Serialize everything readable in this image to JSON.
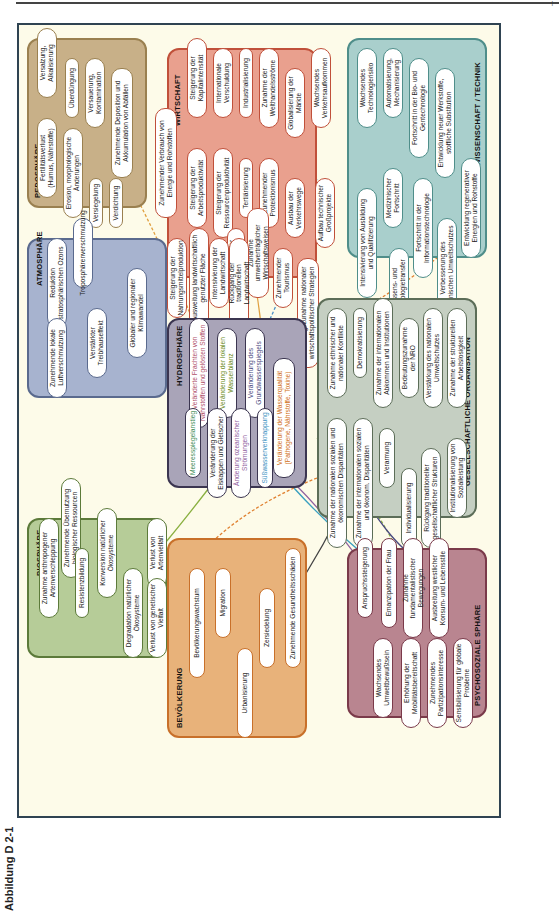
{
  "page": {
    "number": "|",
    "caption": "Abbildung D 2-1"
  },
  "spheres": {
    "pedosphaere": {
      "title": "PEDOSPHÄRE",
      "color": "#c8b088",
      "border": "#9a8050",
      "items": [
        "Versalzung, Alkalisierung",
        "Überdüngung",
        "Versauerung, Kontamination",
        "Zunehmende Deposition und Akkumulation von Abfällen",
        "Fertilitätsverlust (Humus, Nährstoffe)",
        "Erosion, morphologische Änderungen",
        "Versiegelung",
        "Verdichtung"
      ]
    },
    "wirtschaft": {
      "title": "WIRTSCHAFT",
      "color": "#e9a08e",
      "border": "#c0503a",
      "items": [
        "Zunehmender Verbrauch von Energie und Rohstoffen",
        "Steigerung der Kapitalintensität",
        "Internationale Verschuldung",
        "Industrialisierung",
        "Zunahme der Welthandelsströme",
        "Globalisierung der Märkte",
        "Wachsendes Verkehrsaufkommen",
        "Steigerung der Arbeitsproduktivität",
        "Steigerung der Ressourcenproduktivität",
        "Tertiärisierung",
        "Zunehmender Protektionismus",
        "Ausbau der Verkehrswege",
        "Aufbau technischer Großprojekte",
        "Zunahme umweltverträglicher Wirtschaftsweisen",
        "Ausbreitung der Geldwirtschaft",
        "Zunehmender Tourismus",
        "Bedeutungszunahme nationaler wirtschaftspolitischer Strategien",
        "Steigerung der Nahrungsmittelproduktion",
        "Ausweitung landwirtschaftlich genutzter Fläche",
        "Intensivierung der Landwirtschaft",
        "Rückgang der traditionellen Landwirtschaft"
      ]
    },
    "wissenschaft": {
      "title": "WISSENSCHAFT / TECHNIK",
      "color": "#a9cfcc",
      "border": "#4f8e8a",
      "items": [
        "Wachsendes Technologierisiko",
        "Automatisierung, Mechanisierung",
        "Fortschritt in der Bio- und Gentechnologie",
        "Entwicklung neuer Werkstoffe, stoffliche Substitution",
        "Intensivierung von Ausbildung und Qualifizierung",
        "Medizinischer Fortschritt",
        "Wissens- und Technologietransfer",
        "Fortschritt in der Informationstechnologie",
        "Verbesserung des technischen Umweltschutzes",
        "Entwicklung regenerativer Energien und Rohstoffe"
      ]
    },
    "atmosphaere": {
      "title": "ATMOSPHÄRE",
      "color": "#a7b3cf",
      "border": "#5a6a8e",
      "items": [
        "Reduktion stratosphärischen Ozons",
        "Troposphärenverschmutzung",
        "Zunehmende lokale Luftverschmutzung",
        "Verstärkter Treibhauseffekt",
        "Globaler und regionaler Klimawandel"
      ]
    },
    "hydrosphaere": {
      "title": "HYDROSPHÄRE",
      "color": "#a9a4b8",
      "border": "#3b3550",
      "items": [
        "Veränderte Frachten von Nährstoffen und gelösten Stoffen",
        "Veränderung der lokalen Wasserbilanz",
        "Veränderung des Grundwasserspiegels",
        "Veränderung der Wasserqualität (Pathogene, Nährstoffe, Toxine)",
        "Meeresspiegelanstieg",
        "Veränderung der Eiskappen und Gletscher",
        "Änderung ozeanischer Strömungen",
        "Süßwasserverknappung"
      ]
    },
    "gesellschaft": {
      "title": "GESELLSCHAFTLICHE ORGANISATION",
      "color": "#c5cfc2",
      "border": "#5c6d58",
      "items": [
        "Zunahme ethnischer und nationaler Konflikte",
        "Demokratisierung",
        "Zunahme der internationalen Abkommen und Institutionen",
        "Bedeutungszunahme der NRO",
        "Verstärkung des nationalen Umweltschutzes",
        "Zunahme der strukturellen Arbeitslosigkeit",
        "Zunahme der nationalen sozialen und ökonomischen Disparitäten",
        "Zunahme der internationalen sozialen und ökonom. Disparitäten",
        "Verarmung",
        "Individualisierung",
        "Rückgang traditioneller gesellschaftlicher Strukturen",
        "Institutionalisierung von Sozialleistung"
      ]
    },
    "biosphaere": {
      "title": "BIOSPHÄRE",
      "color": "#b6cc98",
      "border": "#5c7a3a",
      "items": [
        "Zunahme anthropogener Artenverschleppung",
        "Zunehmende Übernutzung biologischer Ressourcen",
        "Resistenzbildung",
        "Konversion natürlicher Ökosysteme",
        "Degradation natürlicher Ökosysteme",
        "Verlust von Artenvielfalt",
        "Verlust von genetischer Vielfalt"
      ]
    },
    "bevoelkerung": {
      "title": "BEVÖLKERUNG",
      "color": "#e8b27a",
      "border": "#c8702a",
      "items": [
        "Bevölkerungswachstum",
        "Migration",
        "Urbanisierung",
        "Zersiedelung",
        "Zunehmende Gesundheitsschäden"
      ]
    },
    "psychosozial": {
      "title": "PSYCHOSOZIALE SPHÄRE",
      "color": "#b98590",
      "border": "#7a3a4a",
      "items": [
        "Anspruchssteigerung",
        "Emanzipation der Frau",
        "Zunahme fundamentalistischer Bewegungen",
        "Ausbreitung westlicher Konsum- und Lebensstile",
        "Wachsendes Umweltbewußtsein",
        "Erhöhung der Mobilitätsbereitschaft",
        "Zunehmendes Partizipationsinteresse",
        "Sensibilisierung für globale Probleme"
      ]
    }
  }
}
